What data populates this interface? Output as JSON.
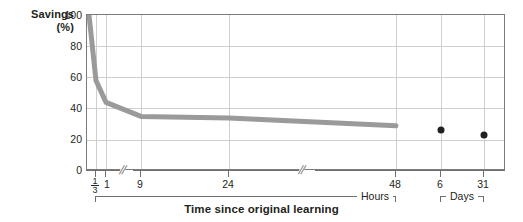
{
  "chart_data": {
    "type": "line",
    "title": "",
    "xlabel": "Time since original learning",
    "ylabel": "Savings",
    "ylabel_unit": "(%)",
    "ylim": [
      0,
      100
    ],
    "yticks": [
      0,
      20,
      40,
      60,
      80,
      100
    ],
    "ytick_labels": [
      "0",
      "20",
      "40",
      "60",
      "80",
      "100"
    ],
    "grid": true,
    "legend": "none",
    "x_axis_breaks": 3,
    "x_groups": [
      {
        "name": "Hours",
        "label": "Hours"
      },
      {
        "name": "Days",
        "label": "Days"
      }
    ],
    "xtick_labels": [
      "1/3",
      "1",
      "9",
      "24",
      "48",
      "6",
      "31"
    ],
    "xtick_values_hours": [
      0.333,
      1,
      9,
      24,
      48,
      144,
      744
    ],
    "series": [
      {
        "name": "Savings curve",
        "color": "#9a9a9a",
        "type": "line",
        "points": [
          {
            "x_label": "0",
            "hours": 0.0,
            "savings": 100
          },
          {
            "x_label": "1/3",
            "hours": 0.333,
            "savings": 58
          },
          {
            "x_label": "1",
            "hours": 1,
            "savings": 44
          },
          {
            "x_label": "9",
            "hours": 9,
            "savings": 35
          },
          {
            "x_label": "24",
            "hours": 24,
            "savings": 34
          },
          {
            "x_label": "48",
            "hours": 48,
            "savings": 29
          }
        ]
      },
      {
        "name": "Long interval points",
        "color": "#231f20",
        "type": "scatter",
        "points": [
          {
            "x_label": "6",
            "days": 6,
            "savings": 26
          },
          {
            "x_label": "31",
            "days": 31,
            "savings": 23
          }
        ]
      }
    ]
  },
  "axis": {
    "y_title": "Savings",
    "y_unit": "(%)",
    "x_title": "Time since original learning",
    "group_hours": "Hours",
    "group_days": "Days",
    "tick_third_num": "1",
    "tick_third_den": "3",
    "tick_1": "1",
    "tick_9": "9",
    "tick_24": "24",
    "tick_48": "48",
    "tick_6": "6",
    "tick_31": "31",
    "ytick_0": "0",
    "ytick_20": "20",
    "ytick_40": "40",
    "ytick_60": "60",
    "ytick_80": "80",
    "ytick_100": "100",
    "break_glyph": "//"
  },
  "colors": {
    "curve": "#9a9a9a",
    "dot": "#231f20",
    "grid": "#cfcfcf",
    "frame": "#7b7b7b",
    "text": "#231f20"
  }
}
